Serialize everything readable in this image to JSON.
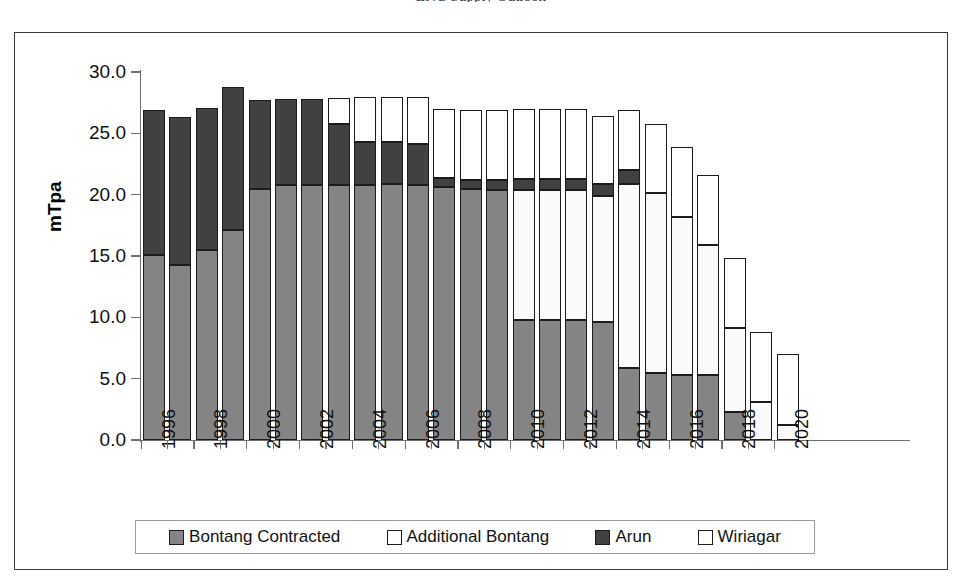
{
  "figure": {
    "caption_sliver": "LNG Supply Outlook",
    "axis_title": "mTpa"
  },
  "legend": {
    "items": [
      {
        "label": "Bontang Contracted",
        "icon": "filled-square-gray-icon",
        "color": "#848484"
      },
      {
        "label": "Additional Bontang",
        "icon": "open-square-icon",
        "color": "#ffffff"
      },
      {
        "label": "Arun",
        "icon": "filled-square-dark-icon",
        "color": "#414141"
      },
      {
        "label": "Wiriagar",
        "icon": "open-square-icon",
        "color": "#ffffff"
      }
    ]
  },
  "chart_data": {
    "type": "bar",
    "stacked": true,
    "title": "",
    "xlabel": "",
    "ylabel": "mTpa",
    "ylim": [
      0,
      30
    ],
    "yticks": [
      "0.0",
      "5.0",
      "10.0",
      "15.0",
      "20.0",
      "25.0",
      "30.0"
    ],
    "ytick_values": [
      0,
      5,
      10,
      15,
      20,
      25,
      30
    ],
    "grid": false,
    "legend_position": "bottom",
    "xtick_label_rotation": 90,
    "xtick_label_interval": 2,
    "categories": [
      "1996",
      "1997",
      "1998",
      "1999",
      "2000",
      "2001",
      "2002",
      "2003",
      "2004",
      "2005",
      "2006",
      "2007",
      "2008",
      "2009",
      "2010",
      "2011",
      "2012",
      "2013",
      "2014",
      "2015",
      "2016",
      "2017",
      "2018",
      "2019",
      "2020"
    ],
    "visible_xtick_labels": [
      "1996",
      "1998",
      "2000",
      "2002",
      "2004",
      "2006",
      "2008",
      "2010",
      "2012",
      "2014",
      "2016",
      "2018",
      "2020"
    ],
    "series": [
      {
        "name": "Bontang Contracted",
        "color": "#848484",
        "values": [
          15.1,
          14.3,
          15.5,
          17.1,
          20.5,
          20.8,
          20.8,
          20.8,
          20.8,
          20.9,
          20.8,
          20.6,
          20.5,
          20.4,
          9.8,
          9.8,
          9.8,
          9.6,
          5.9,
          5.5,
          5.3,
          5.3,
          2.3,
          0.0,
          0.0
        ]
      },
      {
        "name": "Additional Bontang",
        "color": "#ffffff",
        "values": [
          0.0,
          0.0,
          0.0,
          0.0,
          0.0,
          0.0,
          0.0,
          0.0,
          0.0,
          0.0,
          0.0,
          0.0,
          0.0,
          0.0,
          10.6,
          10.6,
          10.6,
          10.3,
          15.0,
          14.6,
          12.9,
          10.6,
          6.8,
          3.1,
          1.2
        ]
      },
      {
        "name": "Arun",
        "color": "#414141",
        "values": [
          11.8,
          12.0,
          11.6,
          11.7,
          7.2,
          7.0,
          7.0,
          5.0,
          3.5,
          3.4,
          3.3,
          0.8,
          0.7,
          0.8,
          0.9,
          0.9,
          0.9,
          1.0,
          1.1,
          0.0,
          0.0,
          0.0,
          0.0,
          0.0,
          0.0
        ]
      },
      {
        "name": "Wiriagar",
        "color": "#ffffff",
        "values": [
          0.0,
          0.0,
          0.0,
          0.0,
          0.0,
          0.0,
          0.0,
          2.1,
          3.7,
          3.7,
          3.9,
          5.6,
          5.7,
          5.7,
          5.7,
          5.7,
          5.7,
          5.5,
          4.9,
          5.7,
          5.7,
          5.7,
          5.7,
          5.7,
          5.8
        ]
      }
    ],
    "totals": [
      26.9,
      26.3,
      27.1,
      28.8,
      27.7,
      27.8,
      27.8,
      27.9,
      28.0,
      28.0,
      28.0,
      27.0,
      26.9,
      26.9,
      27.0,
      27.0,
      27.0,
      26.4,
      26.9,
      25.8,
      23.9,
      21.6,
      14.8,
      8.8,
      7.0
    ]
  }
}
